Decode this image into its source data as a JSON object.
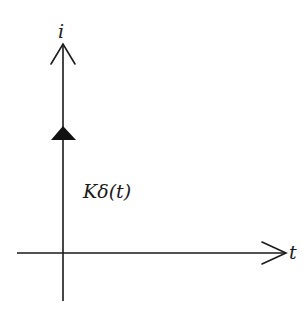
{
  "diagram": {
    "type": "impulse-function-plot",
    "labels": {
      "y_axis": "i",
      "x_axis": "t",
      "impulse": "Kδ(t)"
    },
    "colors": {
      "line": "#1a1a1a",
      "impulse_head": "#111111",
      "background": "#ffffff"
    }
  }
}
